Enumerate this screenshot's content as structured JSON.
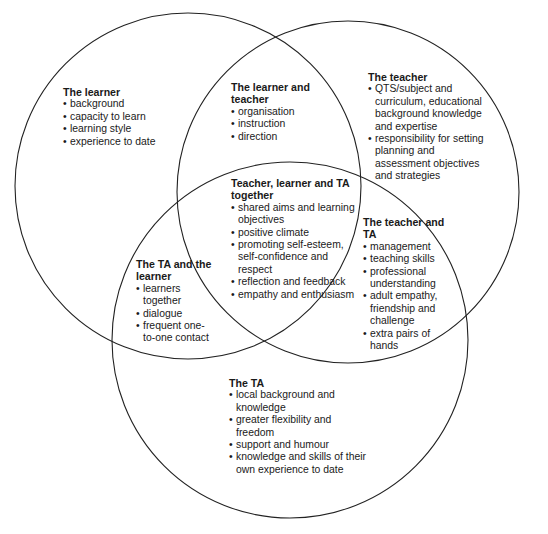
{
  "diagram": {
    "type": "venn-3",
    "stroke_color": "#222222",
    "circles": [
      {
        "name": "The learner",
        "cx": 188,
        "cy": 186,
        "r": 173
      },
      {
        "name": "The teacher",
        "cx": 348,
        "cy": 192,
        "r": 171
      },
      {
        "name": "The TA",
        "cx": 290,
        "cy": 340,
        "r": 178
      }
    ],
    "regions": {
      "learner": {
        "title": "The learner",
        "items": [
          "background",
          "capacity to learn",
          "learning style",
          "experience to date"
        ]
      },
      "learner_teacher": {
        "title": "The learner and teacher",
        "items": [
          "organisation",
          "instruction",
          "direction"
        ]
      },
      "teacher": {
        "title": "The teacher",
        "items": [
          "QTS/subject and curriculum, educational background knowledge and expertise",
          "responsibility for setting planning and assessment objectives and strategies"
        ]
      },
      "all_three": {
        "title": "Teacher, learner and TA together",
        "items": [
          "shared aims and learning objectives",
          "positive climate",
          "promoting self-esteem, self-confidence and respect",
          "reflection and feedback",
          "empathy and enthusiasm"
        ]
      },
      "teacher_ta": {
        "title": "The teacher and TA",
        "items": [
          "management",
          "teaching skills",
          "professional understanding",
          "adult empathy, friendship and challenge",
          "extra pairs of hands"
        ]
      },
      "ta_learner": {
        "title": "The TA and the learner",
        "items": [
          "learners together",
          "dialogue",
          "frequent one-to-one contact"
        ]
      },
      "ta": {
        "title": "The TA",
        "items": [
          "local background and knowledge",
          "greater flexibility and freedom",
          "support and humour",
          "knowledge and skills of their own experience to date"
        ]
      }
    }
  }
}
